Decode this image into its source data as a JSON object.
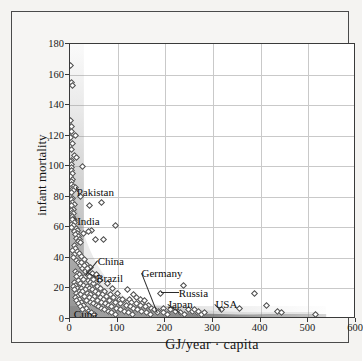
{
  "chart_data": {
    "type": "scatter",
    "title": "",
    "xlabel": "GJ/year · capita",
    "ylabel": "infant mortality",
    "xlim": [
      0,
      600
    ],
    "ylim": [
      0,
      180
    ],
    "xticks": [
      0,
      100,
      200,
      300,
      400,
      500,
      600
    ],
    "yticks": [
      0,
      20,
      40,
      60,
      80,
      100,
      120,
      140,
      160,
      180
    ],
    "grid": true,
    "legend": "none",
    "marker_style": "open-diamond",
    "annotations": [
      {
        "label": "Pakistan",
        "x": 14,
        "y": 83,
        "point_x": 12,
        "point_y": 86
      },
      {
        "label": "India",
        "x": 15,
        "y": 64,
        "point_x": 8,
        "point_y": 66
      },
      {
        "label": "China",
        "x": 58,
        "y": 38,
        "point_x": 32,
        "point_y": 28
      },
      {
        "label": "Brazil",
        "x": 55,
        "y": 27,
        "point_x": 33,
        "point_y": 31
      },
      {
        "label": "Germany",
        "x": 150,
        "y": 30,
        "point_x": 183,
        "point_y": 4
      },
      {
        "label": "Russia",
        "x": 228,
        "y": 17,
        "point_x": 190,
        "point_y": 17
      },
      {
        "label": "Japan",
        "x": 205,
        "y": 10,
        "point_x": 232,
        "point_y": 4
      },
      {
        "label": "USA",
        "x": 305,
        "y": 10,
        "point_x": 318,
        "point_y": 6
      },
      {
        "label": "Cuba",
        "x": 8,
        "y": 3,
        "point_x": 0,
        "point_y": 0
      }
    ],
    "points": [
      [
        1,
        166
      ],
      [
        3,
        155
      ],
      [
        5,
        153
      ],
      [
        2,
        130
      ],
      [
        4,
        126
      ],
      [
        3,
        123
      ],
      [
        12,
        120
      ],
      [
        2,
        119
      ],
      [
        5,
        115
      ],
      [
        3,
        111
      ],
      [
        9,
        107
      ],
      [
        14,
        106
      ],
      [
        4,
        104
      ],
      [
        2,
        103
      ],
      [
        3,
        101
      ],
      [
        26,
        100
      ],
      [
        4,
        99
      ],
      [
        3,
        97
      ],
      [
        6,
        95
      ],
      [
        2,
        93
      ],
      [
        5,
        91
      ],
      [
        4,
        90
      ],
      [
        3,
        88
      ],
      [
        7,
        87
      ],
      [
        12,
        86
      ],
      [
        5,
        85
      ],
      [
        8,
        84
      ],
      [
        4,
        83
      ],
      [
        22,
        80
      ],
      [
        6,
        79
      ],
      [
        3,
        78
      ],
      [
        5,
        76
      ],
      [
        9,
        75
      ],
      [
        4,
        74
      ],
      [
        7,
        72
      ],
      [
        3,
        71
      ],
      [
        5,
        70
      ],
      [
        8,
        69
      ],
      [
        4,
        68
      ],
      [
        6,
        67
      ],
      [
        8,
        66
      ],
      [
        5,
        65
      ],
      [
        10,
        63
      ],
      [
        4,
        62
      ],
      [
        7,
        61
      ],
      [
        3,
        60
      ],
      [
        13,
        59
      ],
      [
        15,
        58
      ],
      [
        9,
        57
      ],
      [
        16,
        56
      ],
      [
        11,
        55
      ],
      [
        18,
        54
      ],
      [
        13,
        53
      ],
      [
        20,
        52
      ],
      [
        17,
        51
      ],
      [
        23,
        50
      ],
      [
        40,
        74
      ],
      [
        66,
        76
      ],
      [
        96,
        61
      ],
      [
        53,
        52
      ],
      [
        70,
        52
      ],
      [
        45,
        58
      ],
      [
        38,
        57
      ],
      [
        28,
        56
      ],
      [
        9,
        48
      ],
      [
        12,
        46
      ],
      [
        6,
        45
      ],
      [
        15,
        44
      ],
      [
        20,
        43
      ],
      [
        10,
        42
      ],
      [
        25,
        41
      ],
      [
        8,
        40
      ],
      [
        30,
        39
      ],
      [
        14,
        38
      ],
      [
        18,
        37
      ],
      [
        35,
        36
      ],
      [
        22,
        35
      ],
      [
        42,
        34
      ],
      [
        26,
        33
      ],
      [
        32,
        32
      ],
      [
        11,
        31
      ],
      [
        33,
        31
      ],
      [
        16,
        30
      ],
      [
        47,
        30
      ],
      [
        19,
        29
      ],
      [
        55,
        29
      ],
      [
        13,
        28
      ],
      [
        32,
        28
      ],
      [
        24,
        27
      ],
      [
        60,
        27
      ],
      [
        28,
        26
      ],
      [
        17,
        25
      ],
      [
        38,
        25
      ],
      [
        9,
        24
      ],
      [
        44,
        24
      ],
      [
        21,
        23
      ],
      [
        50,
        23
      ],
      [
        12,
        22
      ],
      [
        29,
        22
      ],
      [
        36,
        21
      ],
      [
        7,
        21
      ],
      [
        57,
        21
      ],
      [
        15,
        20
      ],
      [
        25,
        20
      ],
      [
        41,
        20
      ],
      [
        63,
        20
      ],
      [
        10,
        19
      ],
      [
        33,
        19
      ],
      [
        48,
        19
      ],
      [
        19,
        18
      ],
      [
        27,
        18
      ],
      [
        54,
        18
      ],
      [
        72,
        18
      ],
      [
        13,
        17
      ],
      [
        37,
        17
      ],
      [
        59,
        17
      ],
      [
        23,
        16
      ],
      [
        44,
        16
      ],
      [
        68,
        16
      ],
      [
        86,
        16
      ],
      [
        16,
        15
      ],
      [
        31,
        15
      ],
      [
        51,
        15
      ],
      [
        77,
        15
      ],
      [
        11,
        14
      ],
      [
        40,
        14
      ],
      [
        64,
        14
      ],
      [
        92,
        14
      ],
      [
        20,
        13
      ],
      [
        47,
        13
      ],
      [
        71,
        13
      ],
      [
        104,
        13
      ],
      [
        125,
        13
      ],
      [
        14,
        12
      ],
      [
        35,
        12
      ],
      [
        57,
        12
      ],
      [
        83,
        12
      ],
      [
        112,
        12
      ],
      [
        24,
        11
      ],
      [
        43,
        11
      ],
      [
        66,
        11
      ],
      [
        95,
        11
      ],
      [
        130,
        11
      ],
      [
        152,
        11
      ],
      [
        17,
        10
      ],
      [
        50,
        10
      ],
      [
        74,
        10
      ],
      [
        106,
        10
      ],
      [
        140,
        10
      ],
      [
        28,
        9
      ],
      [
        55,
        9
      ],
      [
        81,
        9
      ],
      [
        118,
        9
      ],
      [
        147,
        9
      ],
      [
        165,
        9
      ],
      [
        21,
        8
      ],
      [
        60,
        8
      ],
      [
        88,
        8
      ],
      [
        126,
        8
      ],
      [
        158,
        8
      ],
      [
        34,
        7
      ],
      [
        67,
        7
      ],
      [
        97,
        7
      ],
      [
        134,
        7
      ],
      [
        170,
        7
      ],
      [
        196,
        7
      ],
      [
        26,
        6
      ],
      [
        73,
        6
      ],
      [
        105,
        6
      ],
      [
        142,
        6
      ],
      [
        178,
        6
      ],
      [
        210,
        6
      ],
      [
        248,
        6
      ],
      [
        39,
        5
      ],
      [
        80,
        5
      ],
      [
        115,
        5
      ],
      [
        150,
        5
      ],
      [
        186,
        5
      ],
      [
        222,
        5
      ],
      [
        258,
        5
      ],
      [
        46,
        4
      ],
      [
        88,
        4
      ],
      [
        123,
        4
      ],
      [
        160,
        4
      ],
      [
        183,
        4
      ],
      [
        196,
        4
      ],
      [
        232,
        4
      ],
      [
        268,
        4
      ],
      [
        52,
        3
      ],
      [
        95,
        3
      ],
      [
        131,
        3
      ],
      [
        168,
        3
      ],
      [
        204,
        3
      ],
      [
        241,
        3
      ],
      [
        276,
        3
      ],
      [
        318,
        6
      ],
      [
        356,
        7
      ],
      [
        388,
        17
      ],
      [
        412,
        9
      ],
      [
        436,
        5
      ],
      [
        443,
        4
      ],
      [
        516,
        3
      ],
      [
        190,
        17
      ],
      [
        238,
        22
      ],
      [
        262,
        6
      ],
      [
        270,
        5
      ],
      [
        282,
        4
      ],
      [
        148,
        13
      ],
      [
        156,
        12
      ],
      [
        140,
        14
      ],
      [
        133,
        16
      ],
      [
        121,
        19
      ],
      [
        110,
        13
      ],
      [
        100,
        17
      ],
      [
        90,
        20
      ],
      [
        78,
        23
      ],
      [
        62,
        25
      ],
      [
        49,
        26
      ],
      [
        41,
        28
      ],
      [
        36,
        33
      ],
      [
        30,
        35
      ],
      [
        24,
        37
      ]
    ]
  }
}
